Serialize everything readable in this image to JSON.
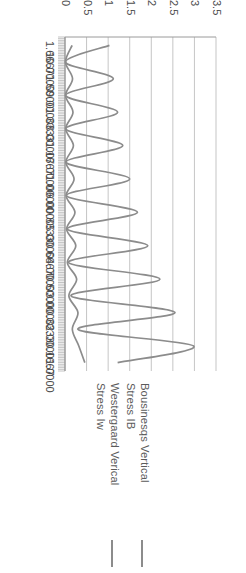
{
  "legend": {
    "position": "top",
    "entries": [
      {
        "line1": "Bousinesqs Vertical",
        "line2": "Stress  IB",
        "color": "#8c8c8c"
      },
      {
        "line1": "Westergaard Verical",
        "line2": "Stress  Iw",
        "color": "#8c8c8c"
      }
    ]
  },
  "chart_data": {
    "type": "line",
    "title": "",
    "subtitle": "",
    "xlabel": "",
    "ylabel": "",
    "orientation": "horizontal",
    "grid": true,
    "rotated_180": true,
    "value_axis": {
      "min": 0,
      "max": 3.5,
      "ticks": [
        0,
        0.5,
        1,
        1.5,
        2,
        2.5,
        3,
        3.5
      ],
      "tick_labels": [
        "0",
        "0.5",
        "1",
        "1.5",
        "2",
        "2.5",
        "3",
        "3.5"
      ]
    },
    "categories": [
      "1.0000",
      "0.1667",
      "2.0000",
      "0.3333",
      "3.0000",
      "0.5000",
      "4.0000",
      "0.6667",
      "5.0000",
      "0.8333",
      "6.0000",
      "1.0000",
      "7.0000",
      "1.1667",
      "8.0000",
      "1.3333",
      "9.0000",
      "1.5000",
      "10.0000",
      "1.6667"
    ],
    "series": [
      {
        "name": "Bousinesqs Vertical Stress  IB",
        "color": "#8c8c8c",
        "values": [
          1.22,
          2.98,
          0.3,
          2.55,
          0.14,
          2.2,
          0.08,
          1.92,
          0.05,
          1.68,
          0.035,
          1.5,
          0.026,
          1.34,
          0.02,
          1.22,
          0.016,
          1.12,
          0.013,
          1.03
        ]
      },
      {
        "name": "Westergaard Verical Stress  Iw",
        "color": "#8c8c8c",
        "values": [
          0.46,
          0.32,
          0.17,
          0.3,
          0.09,
          0.27,
          0.055,
          0.25,
          0.037,
          0.23,
          0.027,
          0.21,
          0.02,
          0.195,
          0.016,
          0.185,
          0.013,
          0.175,
          0.011,
          0.165
        ]
      }
    ]
  }
}
